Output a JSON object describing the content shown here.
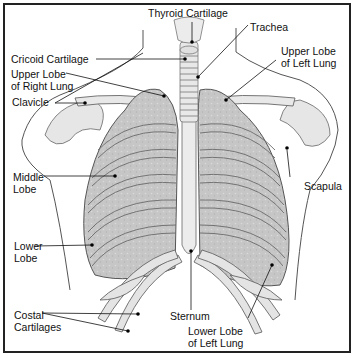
{
  "diagram": {
    "type": "anatomical-illustration",
    "style": {
      "background": "#ffffff",
      "border": "#222222",
      "ink": "#111111",
      "tissue": "#c8c8c8",
      "bone": "#e2e2e2"
    },
    "labels": {
      "thyroid_cartilage": "Thyroid Cartilage",
      "trachea": "Trachea",
      "cricoid_cartilage": "Cricoid Cartilage",
      "upper_lobe_right_1": "Upper Lobe",
      "upper_lobe_right_2": "of Right Lung",
      "upper_lobe_left_1": "Upper Lobe",
      "upper_lobe_left_2": "of Left Lung",
      "clavicle": "Clavicle",
      "middle_lobe_1": "Middle",
      "middle_lobe_2": "Lobe",
      "scapula": "Scapula",
      "lower_lobe_1": "Lower",
      "lower_lobe_2": "Lobe",
      "sternum": "Sternum",
      "costal_cartilages_1": "Costal",
      "costal_cartilages_2": "Cartilages",
      "lower_lobe_left_1": "Lower Lobe",
      "lower_lobe_left_2": "of Left Lung"
    }
  }
}
